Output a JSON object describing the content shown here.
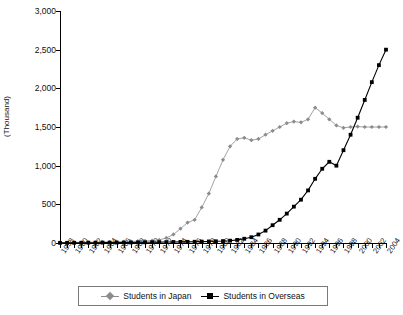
{
  "chart_data": {
    "type": "line",
    "title": "",
    "xlabel": "",
    "ylabel": "(Thousand)",
    "ylim": [
      0,
      3000
    ],
    "ytick_values": [
      0,
      500,
      1000,
      1500,
      2000,
      2500,
      3000
    ],
    "ytick_labels": [
      "0",
      "500",
      "1,000",
      "1,500",
      "2,000",
      "2,500",
      "3,000"
    ],
    "grid": false,
    "legend_position": "bottom",
    "x": [
      1958,
      1959,
      1960,
      1961,
      1962,
      1963,
      1964,
      1965,
      1966,
      1967,
      1968,
      1969,
      1970,
      1971,
      1972,
      1973,
      1974,
      1975,
      1976,
      1977,
      1978,
      1979,
      1980,
      1981,
      1982,
      1983,
      1984,
      1985,
      1986,
      1987,
      1988,
      1989,
      1990,
      1991,
      1992,
      1993,
      1994,
      1995,
      1996,
      1997,
      1998,
      1999,
      2000,
      2001,
      2002,
      2003,
      2004
    ],
    "xtick_labels": [
      "1958",
      "1960",
      "1962",
      "1964",
      "1966",
      "1968",
      "1970",
      "1972",
      "1974",
      "1976",
      "1978",
      "1980",
      "1982",
      "1984",
      "1986",
      "1988",
      "1990",
      "1992",
      "1994",
      "1996",
      "1998",
      "2000",
      "2002",
      "2004"
    ],
    "xtick_label_step": 2,
    "series": [
      {
        "name": "Students in Japan",
        "color": "#8c8c8c",
        "marker": "diamond",
        "values": [
          5,
          6,
          7,
          8,
          9,
          10,
          12,
          14,
          16,
          18,
          20,
          23,
          26,
          30,
          40,
          65,
          110,
          185,
          265,
          300,
          460,
          640,
          860,
          1075,
          1250,
          1345,
          1360,
          1330,
          1345,
          1400,
          1450,
          1500,
          1550,
          1570,
          1560,
          1600,
          1750,
          1680,
          1600,
          1520,
          1490,
          1500,
          1505,
          1500,
          1500,
          1500,
          1500
        ]
      },
      {
        "name": "Students in Overseas",
        "color": "#000000",
        "marker": "square",
        "values": [
          2,
          2,
          3,
          3,
          4,
          4,
          5,
          5,
          6,
          6,
          7,
          8,
          9,
          10,
          11,
          12,
          13,
          14,
          15,
          16,
          18,
          20,
          22,
          25,
          30,
          40,
          55,
          75,
          110,
          160,
          230,
          300,
          380,
          470,
          560,
          680,
          830,
          960,
          1050,
          1000,
          1200,
          1400,
          1620,
          1850,
          2080,
          2300,
          2500
        ]
      }
    ]
  },
  "legend": {
    "items": [
      {
        "label": "Students in Japan",
        "marker": "diamond-marker-icon",
        "color": "#8c8c8c"
      },
      {
        "label": "Students in Overseas",
        "marker": "square-marker-icon",
        "color": "#000000"
      }
    ]
  }
}
